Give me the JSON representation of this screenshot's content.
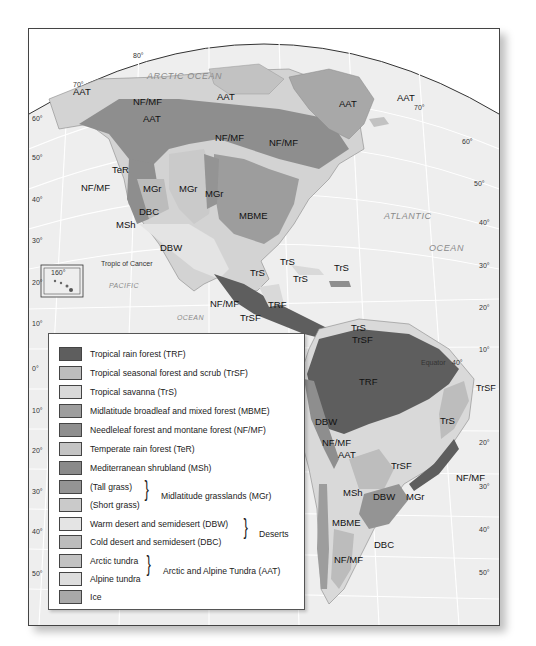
{
  "map": {
    "title": "Biomes of the Americas",
    "oceans": {
      "arctic": "ARCTIC OCEAN",
      "atlantic_1": "ATLANTIC",
      "atlantic_2": "OCEAN",
      "pacific_1": "PACIFIC",
      "pacific_2": "OCEAN"
    },
    "annotations": {
      "tropic": "Tropic of Cancer",
      "equator": "Equator",
      "equator_lon": "40°",
      "inset_lon": "160°"
    },
    "latitude_labels_left": [
      "80°",
      "70°",
      "60°",
      "50°",
      "40°",
      "30°",
      "20°",
      "10°",
      "0°",
      "10°",
      "20°",
      "30°",
      "40°",
      "50°"
    ],
    "latitude_labels_right": [
      "70°",
      "60°",
      "50°",
      "40°",
      "30°",
      "20°",
      "10°",
      "20°",
      "30°",
      "40°",
      "50°"
    ],
    "region_labels": {
      "aat_alaska": "AAT",
      "nfmf_alaska": "NF/MF",
      "aat_yukon": "AAT",
      "aat_canada": "AAT",
      "aat_greenland": "AAT",
      "aat_iceland": "AAT",
      "nfmf_canada": "NF/MF",
      "ter": "TeR",
      "nfmf_west": "NF/MF",
      "mgr_1": "MGr",
      "mgr_2": "MGr",
      "mgr_3": "MGr",
      "dbc_na": "DBC",
      "msh_na": "MSh",
      "mbme_na": "MBME",
      "dbw_na": "DBW",
      "trs_florida": "TrS",
      "trs_cuba": "TrS",
      "trs_hispaniola": "TrS",
      "trs_mexico": "TrS",
      "nfmf_mexico": "NF/MF",
      "trf_central": "TRF",
      "trsf_central": "TrSF",
      "trs_venezuela": "TrS",
      "trsf_venezuela": "TrSF",
      "trf_amazon": "TRF",
      "trsf_brazil": "TrSF",
      "trs_brazil": "TrS",
      "dbw_peru": "DBW",
      "nfmf_andes": "NF/MF",
      "aat_andes": "AAT",
      "trsf_chaco": "TrSF",
      "nfmf_brazil": "NF/MF",
      "msh_chile": "MSh",
      "dbw_argentina": "DBW",
      "mgr_pampas": "MGr",
      "mbme_chile": "MBME",
      "dbc_patagonia": "DBC",
      "nfmf_chile": "NF/MF"
    }
  },
  "legend": {
    "items": [
      {
        "label": "Tropical rain forest (TRF)",
        "color": "#5e5e5e"
      },
      {
        "label": "Tropical seasonal forest and scrub (TrSF)",
        "color": "#bdbdbd"
      },
      {
        "label": "Tropical savanna (TrS)",
        "color": "#d9d9d9"
      },
      {
        "label": "Midlatitude broadleaf and mixed forest (MBME)",
        "color": "#9d9d9d"
      },
      {
        "label": "Needleleaf forest and montane forest (NF/MF)",
        "color": "#8e8e8e"
      },
      {
        "label": "Temperate rain forest (TeR)",
        "color": "#c4c4c4"
      },
      {
        "label": "Mediterranean shrubland (MSh)",
        "color": "#8a8a8a"
      },
      {
        "label": "(Tall grass)",
        "color": "#949494"
      },
      {
        "label": "(Short grass)",
        "color": "#cacaca"
      },
      {
        "label": "Warm desert and semidesert (DBW)",
        "color": "#e4e4e4"
      },
      {
        "label": "Cold desert and semidesert (DBC)",
        "color": "#bcbcbc"
      },
      {
        "label": "Arctic tundra",
        "color": "#c2c2c2"
      },
      {
        "label": "Alpine tundra",
        "color": "#dddddd"
      },
      {
        "label": "Ice",
        "color": "#a8a8a8"
      }
    ],
    "groups": {
      "grasslands": "Midlatitude grasslands (MGr)",
      "deserts": "Deserts",
      "tundra": "Arctic and Alpine Tundra (AAT)"
    }
  },
  "colors": {
    "ocean": "#eeeeee",
    "land_base": "#d3d3d3",
    "trf": "#5e5e5e",
    "nfmf": "#8e8e8e",
    "mbme": "#9d9d9d",
    "tundra": "#c2c2c2",
    "grass_short": "#cacaca",
    "desert_warm": "#e4e4e4",
    "grid": "#ffffff"
  }
}
